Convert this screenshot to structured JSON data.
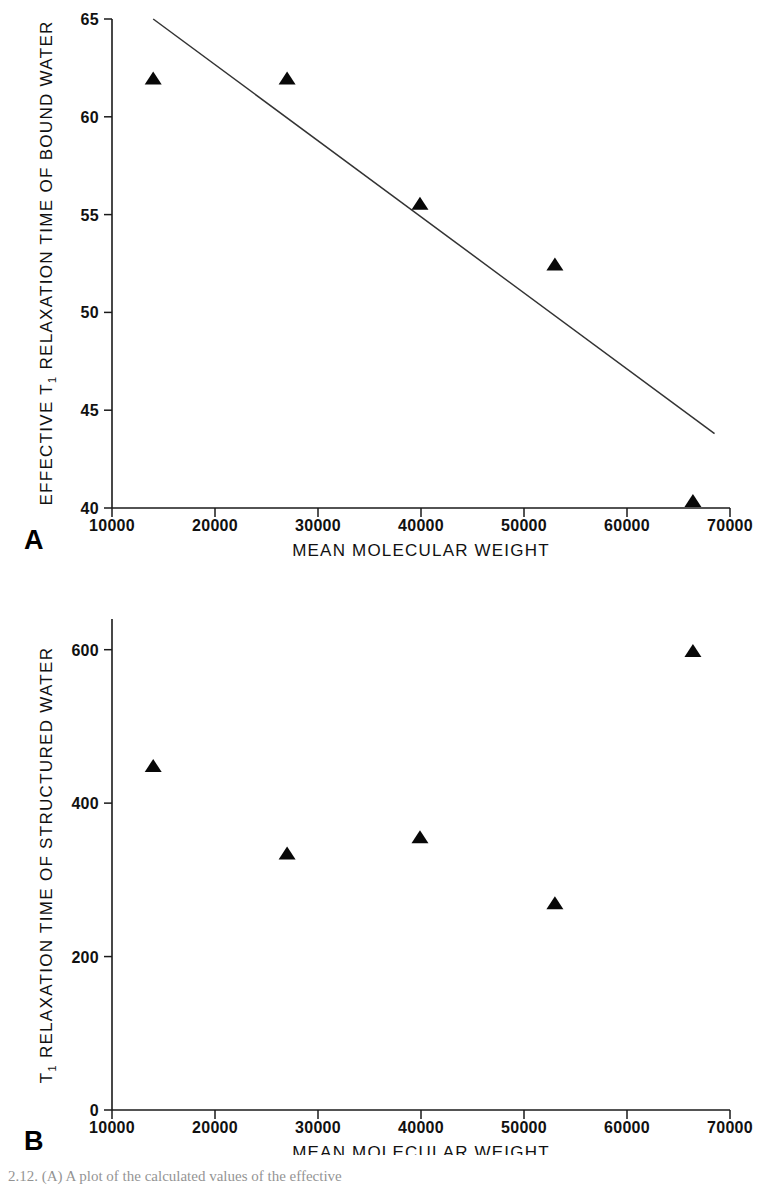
{
  "figure": {
    "caption_fragment": "2.12.  (A) A plot of the calculated  values of  the effective",
    "panels": [
      "A",
      "B"
    ]
  },
  "chart_data": [
    {
      "type": "scatter",
      "panel": "A",
      "title": "",
      "xlabel": "MEAN MOLECULAR WEIGHT",
      "ylabel": "EFFECTIVE T1 RELAXATION TIME OF BOUND WATER",
      "ylabel_parts": {
        "pre": "EFFECTIVE T",
        "sub": "1",
        "post": " RELAXATION TIME OF BOUND WATER"
      },
      "xlim": [
        10000,
        70000
      ],
      "ylim": [
        40,
        65
      ],
      "xticks": [
        10000,
        20000,
        30000,
        40000,
        50000,
        60000,
        70000
      ],
      "xtick_labels": [
        "10000",
        "20000",
        "30000",
        "40000",
        "50000",
        "60000",
        "70000"
      ],
      "yticks": [
        40,
        45,
        50,
        55,
        60,
        65
      ],
      "ytick_labels": [
        "40",
        "45",
        "50",
        "55",
        "60",
        "65"
      ],
      "grid": false,
      "legend": false,
      "marker": "filled-triangle",
      "x": [
        14000,
        27000,
        39900,
        53000,
        66400
      ],
      "y": [
        61.9,
        61.9,
        55.5,
        52.4,
        40.3
      ],
      "trendline": {
        "x": [
          14000,
          68500
        ],
        "y": [
          65.0,
          43.8
        ]
      }
    },
    {
      "type": "scatter",
      "panel": "B",
      "title": "",
      "xlabel": "MEAN MOLECULAR WEIGHT",
      "ylabel": "T1 RELAXATION TIME OF STRUCTURED WATER",
      "ylabel_parts": {
        "pre": "T",
        "sub": "1",
        "post": " RELAXATION TIME OF STRUCTURED WATER"
      },
      "xlim": [
        10000,
        70000
      ],
      "ylim": [
        0,
        640
      ],
      "xticks": [
        10000,
        20000,
        30000,
        40000,
        50000,
        60000,
        70000
      ],
      "xtick_labels": [
        "10000",
        "20000",
        "30000",
        "40000",
        "50000",
        "60000",
        "70000"
      ],
      "yticks": [
        0,
        200,
        400,
        600
      ],
      "ytick_labels": [
        "0",
        "200",
        "400",
        "600"
      ],
      "grid": false,
      "legend": false,
      "marker": "filled-triangle",
      "x": [
        14000,
        27000,
        39900,
        53000,
        66400
      ],
      "y": [
        447,
        333,
        354,
        268,
        597
      ],
      "trendline": null
    }
  ],
  "colors": {
    "axis": "#1a1a1a",
    "marker": "#080808",
    "trendline": "#333333",
    "background": "#ffffff"
  }
}
